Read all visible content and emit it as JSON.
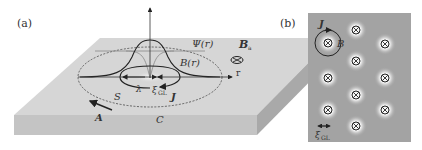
{
  "panel_a": {
    "label": "(a)",
    "psi": "Ψ(r)",
    "b_field": "B(r)",
    "b_applied": "B",
    "b_applied_sub": "a",
    "r_axis": "r",
    "lambda": "λ",
    "xi": "ξ",
    "xi_sub": "GL",
    "s": "S",
    "j": "J",
    "a": "A",
    "c": "C"
  },
  "panel_b": {
    "label": "(b)",
    "j": "J",
    "b": "B",
    "xi": "ξ",
    "xi_sub": "GL",
    "vortex_symbol": "⊗",
    "vortices": [
      {
        "x": 328,
        "y": 43
      },
      {
        "x": 328,
        "y": 78
      },
      {
        "x": 328,
        "y": 110
      },
      {
        "x": 356,
        "y": 30
      },
      {
        "x": 356,
        "y": 61
      },
      {
        "x": 356,
        "y": 95
      },
      {
        "x": 356,
        "y": 126
      },
      {
        "x": 385,
        "y": 44
      },
      {
        "x": 385,
        "y": 78
      },
      {
        "x": 385,
        "y": 110
      }
    ]
  },
  "colors": {
    "slab_top": "#d4d4d4",
    "slab_front": "#c2c2c2",
    "slab_side": "#a8a8a8",
    "panel_b_bg": "#a3a3a3",
    "ink": "#222222"
  }
}
